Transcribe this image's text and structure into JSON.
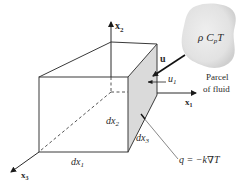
{
  "diagram": {
    "axes": {
      "x1": {
        "label": "x",
        "subscript": "1"
      },
      "x2": {
        "label": "x",
        "subscript": "2"
      },
      "x3": {
        "label": "x",
        "subscript": "3"
      }
    },
    "dimensions": {
      "dx1": {
        "label": "dx",
        "subscript": "1"
      },
      "dx2": {
        "label": "dx",
        "subscript": "2"
      },
      "dx3": {
        "label": "dx",
        "subscript": "3"
      }
    },
    "velocity": {
      "vector_label": "u",
      "component_label": "u",
      "component_subscript": "1"
    },
    "parcel": {
      "expression_rho": "ρ",
      "expression_c": "C",
      "expression_c_subscript": "p",
      "expression_t": "T",
      "caption_line1": "Parcel",
      "caption_line2": "of fluid"
    },
    "heat_flux": {
      "label": "q = −k∇T"
    },
    "colors": {
      "line": "#3a3a3a",
      "shaded_face": "#d9d9d9",
      "parcel_fill": "#e3e3e3",
      "background": "#ffffff"
    }
  }
}
